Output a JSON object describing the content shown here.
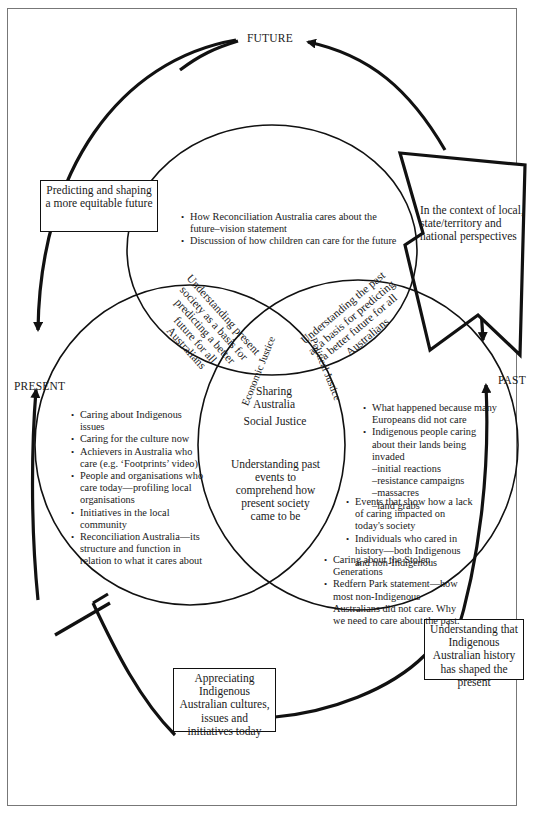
{
  "axis_labels": {
    "future": "FUTURE",
    "present": "PRESENT",
    "past": "PAST"
  },
  "boxes": {
    "predicting": "Predicting and shaping a more equitable future",
    "context": "In the context of local, state/territory and national perspectives",
    "appreciating": "Appreciating Indigenous Australian cultures, issues and initiatives today",
    "understanding_history": "Understanding that Indigenous Australian history has shaped the present"
  },
  "circles": {
    "future": {
      "items": [
        "How Reconciliation Australia cares about the future–vision statement",
        "Discussion of how children can care for the future"
      ]
    },
    "present": {
      "items": [
        "Caring about Indigenous issues",
        "Caring for the culture now",
        "Achievers in Australia who care (e.g. ‘Footprints’ video)",
        "People and organisations who care today—profiling local organisations",
        "Initiatives in the local community",
        "Reconciliation Australia—its structure and function in relation to what it cares about"
      ]
    },
    "past": {
      "items": [
        {
          "text": "What happened because many Europeans did not care",
          "subs": []
        },
        {
          "text": "Indigenous people caring about their lands being invaded",
          "subs": [
            "–initial reactions",
            "–resistance campaigns",
            "–massacres",
            "–land grabs"
          ]
        },
        {
          "text": "Events that show how a lack of caring impacted on today's society",
          "subs": []
        },
        {
          "text": "Individuals who cared in history—both Indigenous and non-Indigenous",
          "subs": []
        },
        {
          "text": "Caring about the Stolen Generations",
          "subs": []
        },
        {
          "text": "Redfern Park statement—how most non-Indigenous Australians did not care. Why we need to care about the past.",
          "subs": []
        }
      ]
    }
  },
  "overlaps": {
    "future_present": "Understanding present society as a basis for predicting a better future for all Australians",
    "future_past": "Understanding the past as a basis for predicting a better future for all Australians",
    "present_past": "Understanding past events to comprehend how present society came to be",
    "center_title": "Sharing Australia",
    "center_sub": "Social Justice",
    "economic": "Economic Justice",
    "political": "Political Justice"
  }
}
